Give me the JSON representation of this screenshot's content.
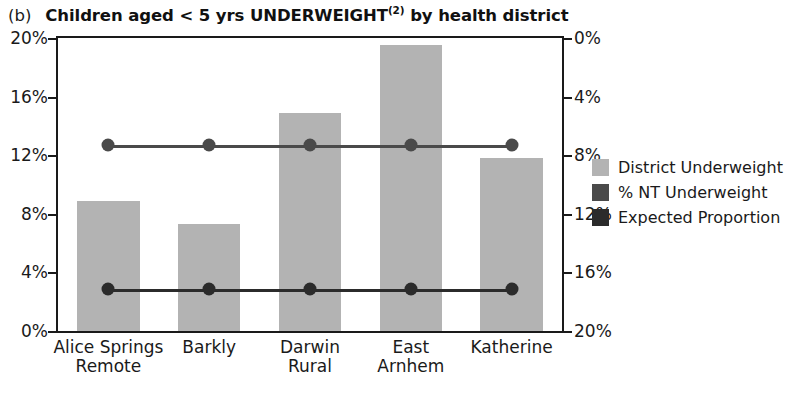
{
  "panel": {
    "letter": "(b)",
    "title_main": "Children aged < 5 yrs UNDERWEIGHT",
    "title_superscript": "(2)",
    "title_tail": " by health district",
    "title_full": "(b) Children aged < 5 yrs UNDERWEIGHT(2) by health district"
  },
  "legend": {
    "items": [
      {
        "label": "District Underweight",
        "color": "#b3b3b3",
        "marker": "bar-swatch"
      },
      {
        "label": "% NT Underweight",
        "color": "#4a4a4a",
        "marker": "line-swatch"
      },
      {
        "label": "Expected Proportion",
        "color": "#2b2b2b",
        "marker": "line-swatch"
      }
    ]
  },
  "axis": {
    "left_ticks": [
      "20%",
      "16%",
      "12%",
      "8%",
      "4%",
      "0%"
    ],
    "right_ticks": [
      "20%",
      "16%",
      "12%",
      "8%",
      "4%",
      "0%"
    ]
  },
  "chart_data": {
    "type": "bar",
    "title": "(b) Children aged < 5 yrs UNDERWEIGHT(2) by health district",
    "xlabel": "",
    "ylabel": "",
    "ylim": [
      0,
      20
    ],
    "ytick_values": [
      0,
      4,
      8,
      12,
      16,
      20
    ],
    "ytick_labels": [
      "0%",
      "4%",
      "8%",
      "12%",
      "16%",
      "20%"
    ],
    "y_unit": "percent",
    "dual_y_axis": true,
    "grid": false,
    "legend_position": "right",
    "categories": [
      "Alice Springs\nRemote",
      "Barkly",
      "Darwin\nRural",
      "East\nArnhem",
      "Katherine"
    ],
    "categories_flat": [
      "Alice Springs Remote",
      "Barkly",
      "Darwin Rural",
      "East Arnhem",
      "Katherine"
    ],
    "series": [
      {
        "name": "District Underweight",
        "type": "bar",
        "color": "#b3b3b3",
        "values": [
          8.9,
          7.3,
          14.9,
          19.5,
          11.8
        ]
      },
      {
        "name": "% NT Underweight",
        "type": "line",
        "color": "#4a4a4a",
        "constant": 12.7,
        "values": [
          12.7,
          12.7,
          12.7,
          12.7,
          12.7
        ]
      },
      {
        "name": "Expected Proportion",
        "type": "line",
        "color": "#2b2b2b",
        "constant": 2.9,
        "values": [
          2.9,
          2.9,
          2.9,
          2.9,
          2.9
        ]
      }
    ]
  }
}
